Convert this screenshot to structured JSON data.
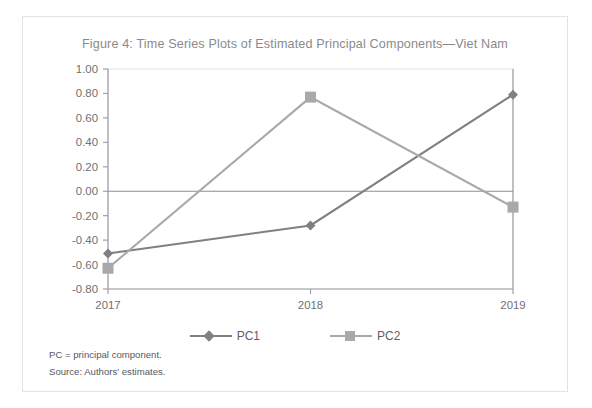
{
  "figure": {
    "title": "Figure 4: Time Series Plots of Estimated Principal Components—Viet Nam",
    "footnote_pc": "PC = principal component.",
    "footnote_source": "Source: Authors' estimates."
  },
  "colors": {
    "pc1": "#808083",
    "pc2": "#a9a9ac",
    "axis": "#a0a0a4",
    "zero_line": "#8e8e92",
    "title_text": "#8a8a8e",
    "tick_text": "#6f6f73",
    "frame_border": "#e3e3e5"
  },
  "chart_data": {
    "type": "line",
    "title": "Figure 4: Time Series Plots of Estimated Principal Components—Viet Nam",
    "xlabel": "",
    "ylabel": "",
    "categories": [
      "2017",
      "2018",
      "2019"
    ],
    "x": [
      2017,
      2018,
      2019
    ],
    "series": [
      {
        "name": "PC1",
        "marker": "diamond",
        "color": "#808083",
        "values": [
          -0.51,
          -0.28,
          0.79
        ]
      },
      {
        "name": "PC2",
        "marker": "square",
        "color": "#a9a9ac",
        "values": [
          -0.63,
          0.77,
          -0.13
        ]
      }
    ],
    "ylim": [
      -0.8,
      1.0
    ],
    "ytick_step": 0.2,
    "ytick_labels": [
      "1.00",
      "0.80",
      "0.60",
      "0.40",
      "0.20",
      "0.00",
      "-0.20",
      "-0.40",
      "-0.60",
      "-0.80"
    ],
    "ytick_values": [
      1.0,
      0.8,
      0.6,
      0.4,
      0.2,
      0.0,
      -0.2,
      -0.4,
      -0.6,
      -0.8
    ],
    "xtick_labels": [
      "2017",
      "2018",
      "2019"
    ],
    "grid": false,
    "zero_line": true,
    "legend": {
      "position": "bottom",
      "entries": [
        "PC1",
        "PC2"
      ]
    }
  }
}
